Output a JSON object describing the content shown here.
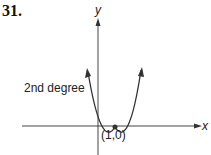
{
  "problem_number": "31.",
  "axes": {
    "x_label": "x",
    "y_label": "y"
  },
  "curve": {
    "label": "2nd degree",
    "type": "parabola"
  },
  "point": {
    "label": "(1,0)"
  }
}
